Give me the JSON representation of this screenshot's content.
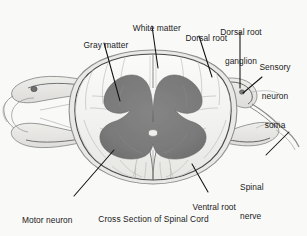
{
  "figure": {
    "title": "Cross Section of Spinal Cord",
    "caption": "Cross Section of Spinal Cord",
    "background_color": "#f9f9f8",
    "gray_matter_color": "#7c7c7c",
    "white_matter_color": "#f2f2f0",
    "outline_color": "#4a4a4a",
    "leader_color": "#111111",
    "text_color": "#1b1b1b"
  },
  "labels": [
    {
      "id": "white-matter",
      "text": "White matter",
      "lines": [
        "White matter"
      ]
    },
    {
      "id": "gray-matter",
      "text": "Gray matter",
      "lines": [
        "Gray matter"
      ]
    },
    {
      "id": "dorsal-root",
      "text": "Dorsal root",
      "lines": [
        "Dorsal root"
      ]
    },
    {
      "id": "dorsal-root-ganglion",
      "text": "Dorsal root ganglion",
      "lines": [
        "Dorsal root",
        "ganglion"
      ]
    },
    {
      "id": "sensory-neuron-soma",
      "text": "Sensory neuron soma",
      "lines": [
        "Sensory",
        "neuron",
        "soma"
      ]
    },
    {
      "id": "spinal-nerve",
      "text": "Spinal nerve",
      "lines": [
        "Spinal",
        "nerve"
      ]
    },
    {
      "id": "ventral-root",
      "text": "Ventral root",
      "lines": [
        "Ventral root"
      ]
    },
    {
      "id": "motor-neuron-soma",
      "text": "Motor neuron soma",
      "lines": [
        "Motor neuron",
        "soma"
      ]
    }
  ],
  "label_text": {
    "white_matter": "White matter",
    "gray_matter": "Gray matter",
    "dorsal_root": "Dorsal root",
    "dorsal_root_ganglion_l1": "Dorsal root",
    "dorsal_root_ganglion_l2": "ganglion",
    "sensory_neuron_soma_l1": "Sensory",
    "sensory_neuron_soma_l2": "neuron",
    "sensory_neuron_soma_l3": "soma",
    "spinal_nerve_l1": "Spinal",
    "spinal_nerve_l2": "nerve",
    "ventral_root": "Ventral root",
    "motor_neuron_soma_l1": "Motor neuron",
    "motor_neuron_soma_l2": "soma"
  },
  "anatomy": {
    "parts": [
      "white matter",
      "gray matter",
      "dorsal root",
      "dorsal root ganglion",
      "sensory neuron soma",
      "spinal nerve",
      "ventral root",
      "motor neuron soma",
      "ventral median fissure",
      "dorsal median septum",
      "central canal"
    ]
  }
}
